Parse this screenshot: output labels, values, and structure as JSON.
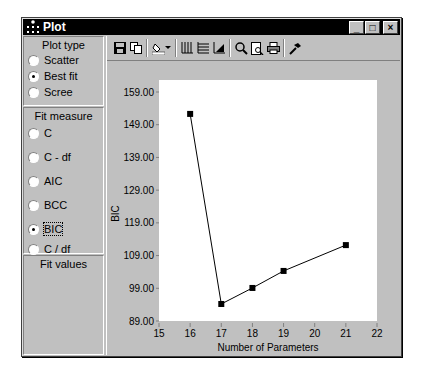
{
  "window": {
    "title": "Plot",
    "controls": {
      "minimize": "_",
      "maximize": "□",
      "close": "×"
    }
  },
  "left_panel": {
    "plot_type": {
      "title": "Plot type",
      "options": [
        {
          "label": "Scatter",
          "selected": false
        },
        {
          "label": "Best fit",
          "selected": true
        },
        {
          "label": "Scree",
          "selected": false
        }
      ]
    },
    "fit_measure": {
      "title": "Fit measure",
      "options": [
        {
          "label": "C",
          "selected": false
        },
        {
          "label": "C - df",
          "selected": false
        },
        {
          "label": "AIC",
          "selected": false
        },
        {
          "label": "BCC",
          "selected": false
        },
        {
          "label": "BIC",
          "selected": true
        },
        {
          "label": "C / df",
          "selected": false
        }
      ]
    },
    "fit_values": {
      "title": "Fit values"
    }
  },
  "toolbar": {
    "icons": [
      "save-icon",
      "copy-icon",
      "fill-color-icon",
      "dropdown-arrow-icon",
      "vertical-grid-icon",
      "horizontal-grid-icon",
      "axis-scale-icon",
      "zoom-icon",
      "print-preview-icon",
      "print-icon",
      "properties-hammer-icon"
    ]
  },
  "chart_data": {
    "type": "line",
    "title": "",
    "xlabel": "Number of Parameters",
    "ylabel": "BIC",
    "x": [
      16,
      17,
      18,
      19,
      21
    ],
    "series": [
      {
        "name": "BIC",
        "values": [
          152.3,
          94.2,
          99.1,
          104.3,
          112.2
        ]
      }
    ],
    "xlim": [
      15,
      22
    ],
    "ylim": [
      89,
      159
    ],
    "x_ticks": [
      "15",
      "16",
      "17",
      "18",
      "19",
      "20",
      "21",
      "22"
    ],
    "y_ticks": [
      "159.00",
      "149.00",
      "139.00",
      "129.00",
      "119.00",
      "109.00",
      "99.00",
      "89.00"
    ],
    "grid": false,
    "legend": "none",
    "marker": "square"
  },
  "colors": {
    "titlebar": "#000000",
    "panel": "#c0c0c0",
    "plot_background": "#ffffff",
    "line": "#000000"
  }
}
